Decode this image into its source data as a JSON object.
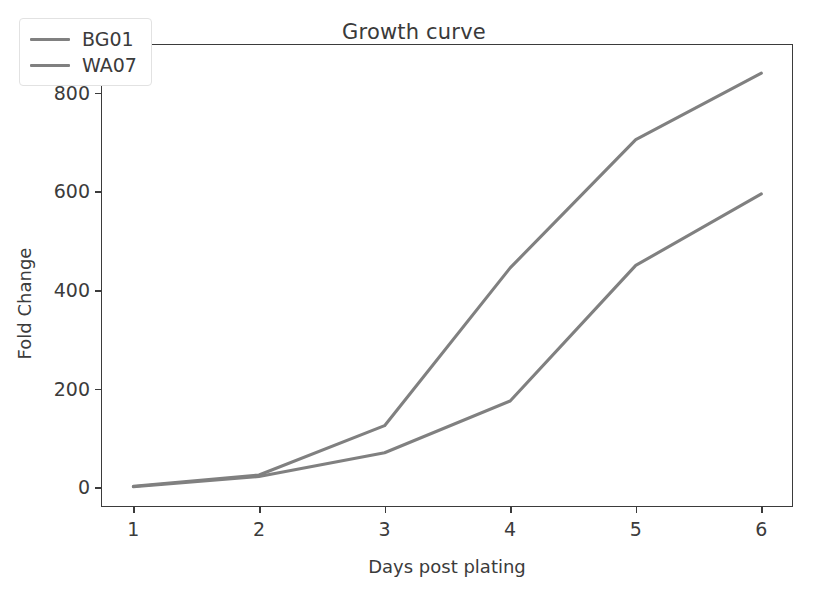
{
  "chart_data": {
    "type": "line",
    "title": "Growth curve",
    "xlabel": "Days post plating",
    "ylabel": "Fold Change",
    "x": [
      1,
      2,
      3,
      4,
      5,
      6
    ],
    "xticklabels": [
      "1",
      "2",
      "3",
      "4",
      "5",
      "6"
    ],
    "yticks": [
      0,
      200,
      400,
      600,
      800
    ],
    "yticklabels": [
      "0",
      "200",
      "400",
      "600",
      "800"
    ],
    "xlim": [
      0.75,
      6.26
    ],
    "ylim": [
      -42,
      897
    ],
    "grid": false,
    "legend_position": "upper left",
    "series": [
      {
        "name": "BG01",
        "color": "#808080",
        "values": [
          2,
          25,
          125,
          445,
          705,
          840
        ]
      },
      {
        "name": "WA07",
        "color": "#808080",
        "values": [
          1,
          22,
          70,
          175,
          450,
          595
        ]
      }
    ]
  },
  "figure": {
    "background_color": "#ffffff",
    "axis_color": "#3b3b3b",
    "line_color": "#808080"
  }
}
